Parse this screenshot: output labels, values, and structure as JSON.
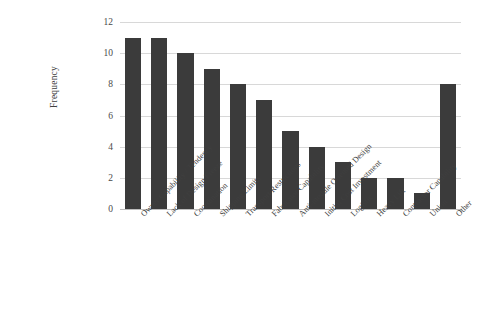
{
  "chart_data": {
    "type": "bar",
    "title": "",
    "xlabel": "",
    "ylabel": "Frequency",
    "ylim": [
      0,
      12
    ],
    "ytick_values": [
      0,
      2,
      4,
      6,
      8,
      10,
      12
    ],
    "ytick_labels": [
      "0",
      "2",
      "4",
      "6",
      "8",
      "10",
      "12"
    ],
    "grid": true,
    "legend": "none",
    "orientation": "vertical",
    "bar_color": "#3b3b3b",
    "gridline_color": "#d8d8d8",
    "background_color": "#ffffff",
    "categories": [
      "Owner Capability / Tendency",
      "Lack of Design Freeze",
      "Coordination",
      "Shipping Limits",
      "Transport Restrictions",
      "Fabricator Capability",
      "Anti-module Oriented Design",
      "Initial Cost Investment",
      "Logistic",
      "Heavy Lift",
      "Contractor Capability",
      "Union",
      "Other"
    ],
    "values": [
      11,
      11,
      10,
      9,
      8,
      7,
      5,
      4,
      3,
      2,
      2,
      1,
      8
    ]
  }
}
